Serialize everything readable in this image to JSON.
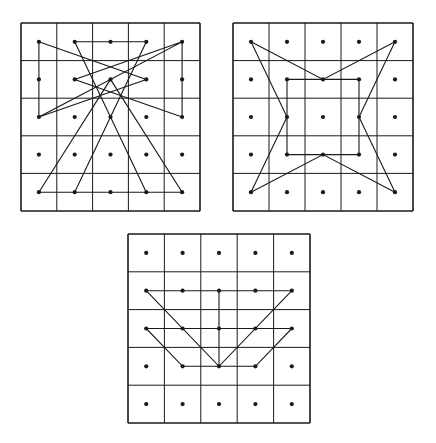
{
  "figure": {
    "background": "#ffffff",
    "ink": "#1a1a1a",
    "grid_size": 5,
    "panels": [
      {
        "id": "top-left",
        "box": {
          "left": 21,
          "top": 23,
          "width": 179,
          "height": 188
        },
        "polylines": [
          [
            [
              0,
              0
            ],
            [
              0,
              2
            ],
            [
              4,
              0
            ],
            [
              4,
              2
            ],
            [
              1,
              1
            ],
            [
              4,
              0
            ]
          ],
          [
            [
              0,
              0
            ],
            [
              3,
              1
            ],
            [
              0,
              2
            ]
          ],
          [
            [
              1,
              4
            ],
            [
              3,
              0
            ],
            [
              1,
              0
            ],
            [
              3,
              4
            ]
          ],
          [
            [
              0,
              4
            ],
            [
              2,
              1
            ],
            [
              4,
              4
            ],
            [
              0,
              4
            ]
          ]
        ]
      },
      {
        "id": "top-right",
        "box": {
          "left": 233,
          "top": 23,
          "width": 180,
          "height": 188
        },
        "polylines": [
          [
            [
              0,
              0
            ],
            [
              2,
              1
            ],
            [
              4,
              0
            ],
            [
              3,
              2
            ],
            [
              4,
              4
            ],
            [
              2,
              3
            ],
            [
              0,
              4
            ],
            [
              1,
              2
            ],
            [
              0,
              0
            ]
          ],
          [
            [
              1,
              1
            ],
            [
              3,
              1
            ],
            [
              3,
              3
            ],
            [
              1,
              3
            ],
            [
              1,
              1
            ]
          ]
        ]
      },
      {
        "id": "bottom-center",
        "box": {
          "left": 128,
          "top": 234,
          "width": 182,
          "height": 189
        },
        "polylines": [
          [
            [
              0,
              1
            ],
            [
              4,
              1
            ]
          ],
          [
            [
              0,
              1
            ],
            [
              2,
              3
            ],
            [
              4,
              1
            ]
          ],
          [
            [
              2,
              1
            ],
            [
              2,
              3
            ]
          ],
          [
            [
              0,
              2
            ],
            [
              4,
              2
            ]
          ],
          [
            [
              0,
              2
            ],
            [
              1,
              3
            ],
            [
              3,
              3
            ],
            [
              4,
              2
            ]
          ]
        ]
      }
    ]
  }
}
